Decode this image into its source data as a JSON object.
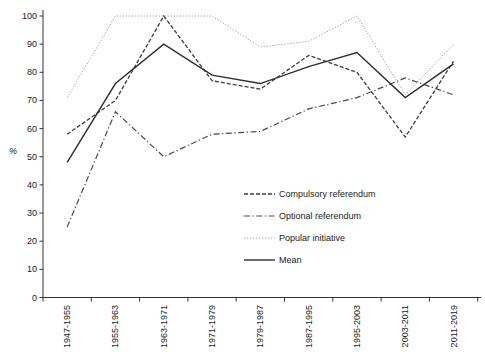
{
  "figure": {
    "background": "#ffffff",
    "axis_color": "#333333"
  },
  "chart_data": {
    "type": "line",
    "title": "",
    "xlabel": "",
    "ylabel": "%",
    "ylim": [
      0,
      100
    ],
    "y_ticks": [
      0,
      10,
      20,
      30,
      40,
      50,
      60,
      70,
      80,
      90,
      100
    ],
    "grid": false,
    "legend_position": "inside-middle-right",
    "x_tick_label_rotation": 90,
    "categories": [
      "1947-1955",
      "1955-1963",
      "1963-1971",
      "1971-1979",
      "1979-1987",
      "1987-1995",
      "1995-2003",
      "2003-2011",
      "2011-2019"
    ],
    "series": [
      {
        "name": "Compulsory referendum",
        "style": "dashed",
        "color": "#3d3d3d",
        "width": 1.3,
        "dash": "4,2",
        "values": [
          58,
          70,
          100,
          77,
          74,
          86,
          80,
          57,
          84
        ]
      },
      {
        "name": "Optional referendum",
        "style": "dashdot",
        "color": "#4a4a4a",
        "width": 1.2,
        "dash": "6,2.5,1.3,2.5",
        "values": [
          25,
          66,
          50,
          58,
          59,
          67,
          71,
          78,
          72
        ]
      },
      {
        "name": "Popular initiative",
        "style": "dotted",
        "color": "#a0a0a0",
        "width": 1,
        "dash": "1.3,1.7",
        "values": [
          71,
          100,
          100,
          100,
          89,
          91,
          100,
          72,
          90
        ]
      },
      {
        "name": "Mean",
        "style": "solid",
        "color": "#2e2e2e",
        "width": 1.4,
        "dash": "",
        "values": [
          48,
          76,
          90,
          79,
          76,
          82,
          87,
          71,
          83
        ]
      }
    ]
  }
}
